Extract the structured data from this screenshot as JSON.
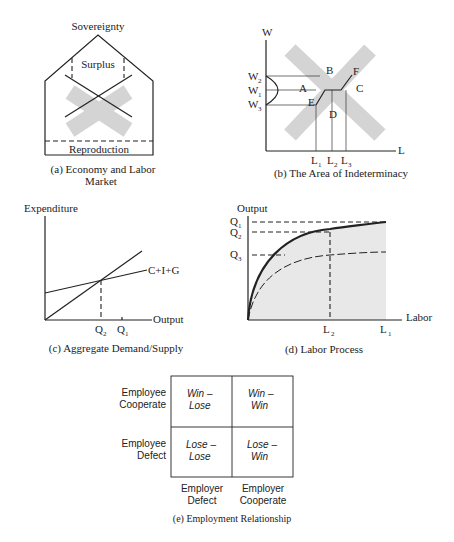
{
  "panels": {
    "a": {
      "top_label": "Sovereignty",
      "inner_label": "Surplus",
      "bottom_label": "Reproduction",
      "caption_line1": "(a) Economy and Labor",
      "caption_line2": "Market"
    },
    "b": {
      "y_axis": "W",
      "x_axis": "L",
      "y_ticks": [
        "W",
        "W",
        "W"
      ],
      "y_subs": [
        "2",
        "1",
        "3"
      ],
      "x_ticks": [
        "L",
        "L",
        "L"
      ],
      "x_subs": [
        "1",
        "2",
        "3"
      ],
      "regions": {
        "A": "A",
        "B": "B",
        "C": "C",
        "D": "D",
        "E": "E",
        "F": "F"
      },
      "caption": "(b) The Area of Indeterminacy"
    },
    "c": {
      "y_axis": "Expenditure",
      "x_axis": "Output",
      "line_label": "C+I+G",
      "x_ticks": [
        "Q",
        "Q"
      ],
      "x_subs": [
        "2",
        "1"
      ],
      "caption": "(c) Aggregate Demand/Supply"
    },
    "d": {
      "y_axis": "Output",
      "x_axis": "Labor",
      "y_ticks": [
        "Q",
        "Q",
        "Q"
      ],
      "y_subs": [
        "1",
        "2",
        "3"
      ],
      "x_ticks": [
        "L",
        "L"
      ],
      "x_subs": [
        "2",
        "1"
      ],
      "caption": "(d) Labor Process"
    },
    "e": {
      "rows": [
        {
          "line1": "Employee",
          "line2": "Cooperate"
        },
        {
          "line1": "Employee",
          "line2": "Defect"
        }
      ],
      "cols": [
        {
          "line1": "Employer",
          "line2": "Defect"
        },
        {
          "line1": "Employer",
          "line2": "Cooperate"
        }
      ],
      "cells": [
        [
          {
            "line1": "Win –",
            "line2": "Lose"
          },
          {
            "line1": "Win –",
            "line2": "Win"
          }
        ],
        [
          {
            "line1": "Lose –",
            "line2": "Lose"
          },
          {
            "line1": "Lose –",
            "line2": "Win"
          }
        ]
      ],
      "caption": "(e) Employment Relationship"
    }
  }
}
